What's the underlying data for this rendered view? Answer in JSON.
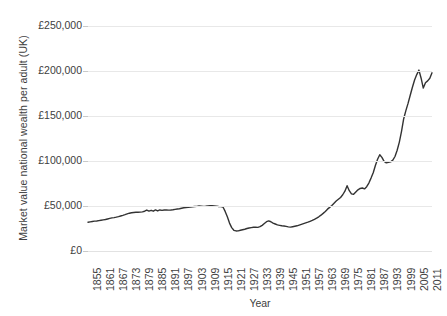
{
  "chart_data": {
    "type": "line",
    "title": "",
    "xlabel": "Year",
    "ylabel": "Market value national wealth per adult (UK)",
    "ylim": [
      0,
      250000
    ],
    "xlim": [
      1855,
      2013
    ],
    "grid": true,
    "legend": null,
    "y_tick_labels": [
      "£250,000",
      "£200,000",
      "£150,000",
      "£100,000",
      "£50,000",
      "£0"
    ],
    "y_tick_values": [
      250000,
      200000,
      150000,
      100000,
      50000,
      0
    ],
    "x_tick_labels": [
      "1855",
      "1861",
      "1867",
      "1873",
      "1879",
      "1885",
      "1891",
      "1897",
      "1903",
      "1909",
      "1915",
      "1921",
      "1927",
      "1933",
      "1939",
      "1945",
      "1951",
      "1957",
      "1963",
      "1969",
      "1975",
      "1981",
      "1987",
      "1993",
      "1999",
      "2005",
      "2011"
    ],
    "x_tick_values": [
      1855,
      1861,
      1867,
      1873,
      1879,
      1885,
      1891,
      1897,
      1903,
      1909,
      1915,
      1921,
      1927,
      1933,
      1939,
      1945,
      1951,
      1957,
      1963,
      1969,
      1975,
      1981,
      1987,
      1993,
      1999,
      2005,
      2011
    ],
    "line_color": "#333333",
    "grid_color": "#e8e8e8",
    "series": [
      {
        "name": "Market value national wealth per adult (UK)",
        "x": [
          1855,
          1856,
          1857,
          1858,
          1859,
          1860,
          1861,
          1862,
          1863,
          1864,
          1865,
          1866,
          1867,
          1868,
          1869,
          1870,
          1871,
          1872,
          1873,
          1874,
          1875,
          1876,
          1877,
          1878,
          1879,
          1880,
          1881,
          1882,
          1883,
          1884,
          1885,
          1886,
          1887,
          1888,
          1889,
          1890,
          1891,
          1892,
          1893,
          1894,
          1895,
          1896,
          1897,
          1898,
          1899,
          1900,
          1901,
          1902,
          1903,
          1904,
          1905,
          1906,
          1907,
          1908,
          1909,
          1910,
          1911,
          1912,
          1913,
          1914,
          1915,
          1916,
          1917,
          1918,
          1919,
          1920,
          1921,
          1922,
          1923,
          1924,
          1925,
          1926,
          1927,
          1928,
          1929,
          1930,
          1931,
          1932,
          1933,
          1934,
          1935,
          1936,
          1937,
          1938,
          1939,
          1940,
          1941,
          1942,
          1943,
          1944,
          1945,
          1946,
          1947,
          1948,
          1949,
          1950,
          1951,
          1952,
          1953,
          1954,
          1955,
          1956,
          1957,
          1958,
          1959,
          1960,
          1961,
          1962,
          1963,
          1964,
          1965,
          1966,
          1967,
          1968,
          1969,
          1970,
          1971,
          1972,
          1973,
          1974,
          1975,
          1976,
          1977,
          1978,
          1979,
          1980,
          1981,
          1982,
          1983,
          1984,
          1985,
          1986,
          1987,
          1988,
          1989,
          1990,
          1991,
          1992,
          1993,
          1994,
          1995,
          1996,
          1997,
          1998,
          1999,
          2000,
          2001,
          2002,
          2003,
          2004,
          2005,
          2006,
          2007,
          2008,
          2009,
          2010,
          2011,
          2012,
          2013
        ],
        "values": [
          32000,
          32400,
          32800,
          33200,
          33400,
          33800,
          34200,
          34600,
          35000,
          35600,
          36200,
          36800,
          37100,
          37600,
          38200,
          38900,
          39600,
          40400,
          41300,
          42000,
          42500,
          42800,
          43000,
          43100,
          43200,
          43500,
          44200,
          45500,
          44300,
          45200,
          44200,
          45600,
          44500,
          45600,
          45200,
          45600,
          45500,
          45400,
          45500,
          45800,
          46200,
          46600,
          47000,
          47500,
          48000,
          48300,
          48500,
          48800,
          49200,
          49400,
          49600,
          50000,
          49800,
          49600,
          49800,
          50100,
          50300,
          50200,
          50000,
          49800,
          49500,
          49300,
          48900,
          44000,
          38000,
          31000,
          26000,
          23000,
          22300,
          22400,
          23000,
          23600,
          24200,
          25000,
          25600,
          26000,
          26400,
          26400,
          26300,
          27000,
          28500,
          30500,
          32600,
          33500,
          32500,
          31000,
          30000,
          29000,
          28500,
          28000,
          27800,
          27300,
          26800,
          26500,
          27000,
          27500,
          28000,
          28800,
          29600,
          30400,
          31200,
          32000,
          33000,
          34000,
          35200,
          36500,
          38000,
          39800,
          41800,
          44000,
          46500,
          48500,
          50500,
          53000,
          55500,
          57500,
          59500,
          62500,
          66500,
          72500,
          67000,
          63500,
          63000,
          65500,
          68000,
          69500,
          70000,
          69000,
          71500,
          75500,
          81000,
          87000,
          95000,
          102000,
          107000,
          104000,
          99500,
          98000,
          98500,
          99000,
          101000,
          105000,
          112000,
          121000,
          133000,
          147000,
          156000,
          164000,
          173000,
          182000,
          190000,
          196000,
          201000,
          192000,
          181000,
          187000,
          189000,
          192000,
          198000
        ]
      }
    ]
  }
}
